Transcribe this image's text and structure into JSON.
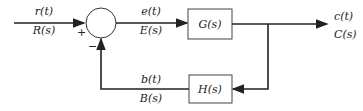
{
  "diagram": {
    "type": "feedback control block diagram",
    "input": {
      "time": "r(t)",
      "laplace": "R(s)"
    },
    "error": {
      "time": "e(t)",
      "laplace": "E(s)"
    },
    "output": {
      "time": "c(t)",
      "laplace": "C(s)"
    },
    "feedback": {
      "time": "b(t)",
      "laplace": "B(s)"
    },
    "forward_block": "G(s)",
    "feedback_block": "H(s)",
    "summing_junction": {
      "plus": "+",
      "minus": "−"
    },
    "colors": {
      "line": "#222222",
      "background": "#ffffff"
    }
  }
}
